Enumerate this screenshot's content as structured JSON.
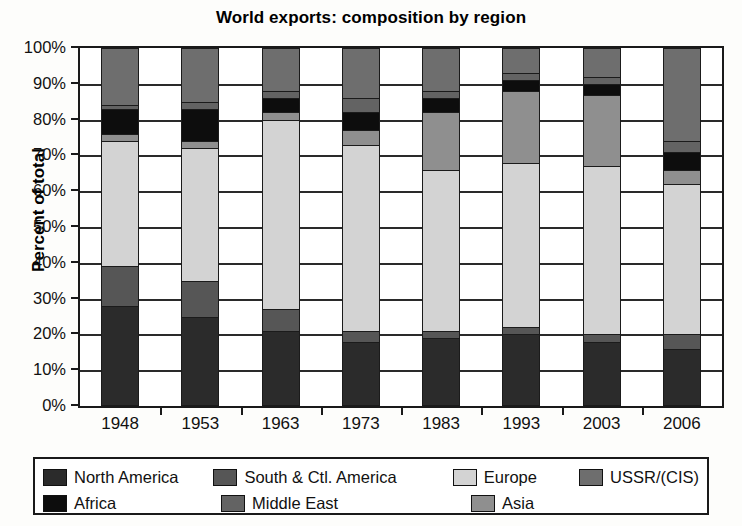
{
  "chart_data": {
    "type": "bar",
    "subtype": "stacked-100-percent",
    "title": "World exports: composition by region",
    "xlabel": "",
    "ylabel": "Percent of total",
    "ylim": [
      0,
      100
    ],
    "ytick_labels": [
      "100%",
      "90%",
      "80%",
      "70%",
      "60%",
      "50%",
      "40%",
      "30%",
      "20%",
      "10%",
      "0%"
    ],
    "ytick_values": [
      100,
      90,
      80,
      70,
      60,
      50,
      40,
      30,
      20,
      10,
      0
    ],
    "grid": true,
    "legend_position": "bottom",
    "categories": [
      "1948",
      "1953",
      "1963",
      "1973",
      "1983",
      "1993",
      "2003",
      "2006"
    ],
    "series": [
      {
        "name": "North America",
        "color": "#2b2b2b",
        "values": [
          28,
          25,
          21,
          18,
          19,
          20,
          18,
          16
        ]
      },
      {
        "name": "South & Ctl. America",
        "color": "#565656",
        "values": [
          11,
          10,
          6,
          3,
          2,
          2,
          2,
          4
        ]
      },
      {
        "name": "Europe",
        "color": "#d3d3d3",
        "values": [
          35,
          37,
          53,
          52,
          45,
          46,
          47,
          42
        ]
      },
      {
        "name": "Asia",
        "color": "#8f8f8f",
        "values": [
          2,
          2,
          2,
          4,
          16,
          20,
          20,
          4
        ]
      },
      {
        "name": "Africa",
        "color": "#0d0d0d",
        "values": [
          7,
          9,
          4,
          5,
          4,
          3,
          3,
          5
        ]
      },
      {
        "name": "Middle East",
        "color": "#636363",
        "values": [
          1,
          2,
          2,
          4,
          2,
          2,
          2,
          3
        ]
      },
      {
        "name": "USSR/(CIS)",
        "color": "#6e6e6e",
        "values": [
          16,
          15,
          12,
          14,
          12,
          7,
          8,
          26
        ]
      }
    ],
    "stack_order_bottom_to_top": [
      "North America",
      "South & Ctl. America",
      "Europe",
      "Asia",
      "Africa",
      "Middle East",
      "USSR/(CIS)"
    ],
    "cumulative_boundaries": {
      "1948": [
        28,
        39,
        74,
        76,
        83,
        84,
        100
      ],
      "1953": [
        25,
        35,
        72,
        74,
        83,
        85,
        100
      ],
      "1963": [
        21,
        27,
        80,
        82,
        86,
        88,
        100
      ],
      "1973": [
        18,
        21,
        73,
        77,
        82,
        86,
        100
      ],
      "1983": [
        19,
        21,
        66,
        82,
        86,
        88,
        100
      ],
      "1993": [
        20,
        22,
        68,
        68,
        73,
        75,
        100
      ],
      "2003": [
        18,
        20,
        67,
        67,
        72,
        74,
        100
      ],
      "2006": [
        16,
        20,
        62,
        66,
        71,
        74,
        100
      ]
    }
  },
  "legend": {
    "row1": [
      {
        "label": "North America",
        "color": "#2b2b2b"
      },
      {
        "label": "South & Ctl. America",
        "color": "#565656"
      },
      {
        "label": "Europe",
        "color": "#d3d3d3"
      },
      {
        "label": "USSR/(CIS)",
        "color": "#6e6e6e"
      }
    ],
    "row2": [
      {
        "label": "Africa",
        "color": "#0d0d0d"
      },
      {
        "label": "Middle East",
        "color": "#636363"
      },
      {
        "label": "Asia",
        "color": "#8f8f8f"
      }
    ]
  }
}
